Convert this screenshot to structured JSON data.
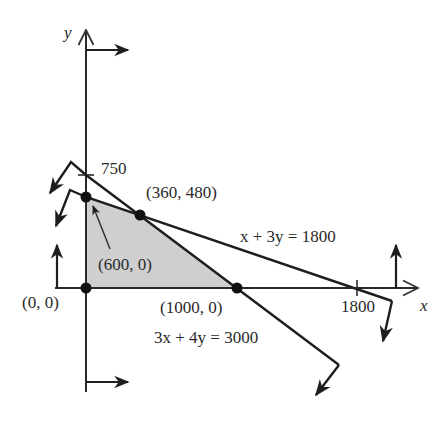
{
  "diagram": {
    "type": "feasible-region-graph",
    "axes": {
      "x_label": "x",
      "y_label": "y",
      "x_tick_label": "1800",
      "y_tick_label": "750"
    },
    "lines": [
      {
        "equation": "x + 3y = 1800",
        "x_intercept": 1800,
        "y_intercept": 600
      },
      {
        "equation": "3x + 4y = 3000",
        "x_intercept": 1000,
        "y_intercept": 750
      }
    ],
    "points": [
      {
        "label": "(0, 0)",
        "x": 0,
        "y": 0
      },
      {
        "label": "(360, 480)",
        "x": 360,
        "y": 480
      },
      {
        "label": "(1000, 0)",
        "x": 1000,
        "y": 0
      },
      {
        "label": "(600, 0)",
        "x": 0,
        "y": 600,
        "note": "label shown as (600, 0) with arrow pointing to y-axis vertex"
      }
    ],
    "feasible_region": {
      "vertices": [
        "(0, 0)",
        "(0, 600)",
        "(360, 480)",
        "(1000, 0)"
      ],
      "fill": "#cfcfcf"
    },
    "colors": {
      "line": "#1e1e1e",
      "region": "#cfcfcf",
      "text": "#2a2a2a",
      "background": "#ffffff"
    }
  }
}
